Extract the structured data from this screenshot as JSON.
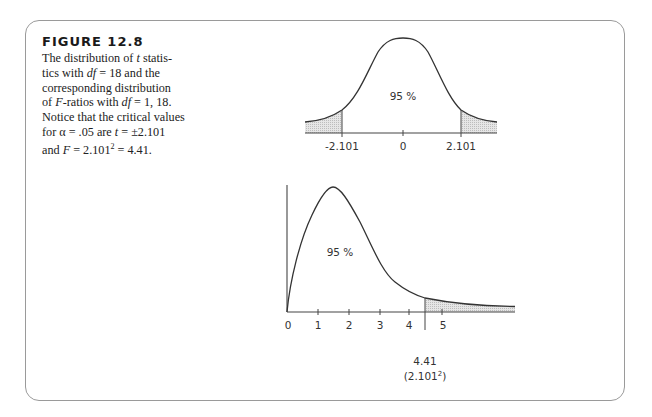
{
  "figure": {
    "title": "FIGURE 12.8",
    "caption_lines": [
      [
        "The distribution of ",
        {
          "i": "t"
        },
        " statis-"
      ],
      [
        "tics with ",
        {
          "i": "df"
        },
        " = 18 and the"
      ],
      [
        "corresponding distribution"
      ],
      [
        "of ",
        {
          "i": "F"
        },
        "-ratios with ",
        {
          "i": "df"
        },
        " = 1, 18."
      ],
      [
        "Notice that the critical values"
      ],
      [
        "for α = .05 are ",
        {
          "i": "t"
        },
        " = ±2.101"
      ],
      [
        "and ",
        {
          "i": "F"
        },
        " = 2.101",
        {
          "sup": "2"
        },
        " = 4.41."
      ]
    ]
  },
  "chart_data": [
    {
      "type": "area",
      "title": "t distribution (df = 18)",
      "distribution": "t",
      "df": 18,
      "center_label": "95 %",
      "tick_labels": [
        "-2.101",
        "0",
        "2.101"
      ],
      "critical_values": [
        -2.101,
        2.101
      ],
      "shaded_regions": [
        "left tail < -2.101",
        "right tail > 2.101"
      ],
      "xlabel": "",
      "ylabel": "",
      "grid": false
    },
    {
      "type": "area",
      "title": "F distribution (df = 1, 18)",
      "distribution": "F",
      "df": [
        1,
        18
      ],
      "center_label": "95 %",
      "tick_labels": [
        "0",
        "1",
        "2",
        "3",
        "4",
        "5"
      ],
      "x": [
        0,
        1,
        2,
        3,
        4,
        5
      ],
      "critical_value": 4.41,
      "critical_label": "4.41",
      "critical_sublabel": "(2.101²)",
      "shaded_regions": [
        "right tail > 4.41"
      ],
      "xlim": [
        0,
        7.2
      ],
      "xlabel": "",
      "ylabel": "",
      "grid": false
    }
  ],
  "labels": {
    "t_center_pct": "95 %",
    "t_neg": "-2.101",
    "t_zero": "0",
    "t_pos": "2.101",
    "f_center_pct": "95 %",
    "f_ticks": [
      "0",
      "1",
      "2",
      "3",
      "4",
      "5"
    ],
    "f_crit": "4.41",
    "f_crit_paren_open": "(2.101",
    "f_crit_sup": "2",
    "f_crit_paren_close": ")"
  },
  "colors": {
    "border": "#9a9a9a",
    "curve": "#333333",
    "shade": "#d9d9d9",
    "text": "#222222"
  }
}
